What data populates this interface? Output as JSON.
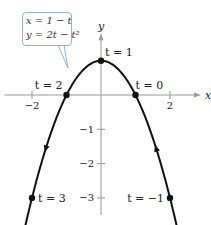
{
  "diagram": {
    "type": "parametric-curve",
    "equations": {
      "x_eq": "x = 1 − t",
      "y_eq": "y = 2t − t²"
    },
    "axes": {
      "x_label": "x",
      "y_label": "y",
      "x_ticks": [
        {
          "value": -2,
          "label": "−2"
        },
        {
          "value": 2,
          "label": "2"
        }
      ],
      "y_ticks": [
        {
          "value": -1,
          "label": "−1"
        },
        {
          "value": -2,
          "label": "−2"
        },
        {
          "value": -3,
          "label": "−3"
        }
      ],
      "x_range": [
        -2.8,
        2.9
      ],
      "y_range": [
        -3.5,
        1.8
      ]
    },
    "t_range": [
      -1.5,
      3.5
    ],
    "points": [
      {
        "t": -1,
        "label": "t = −1"
      },
      {
        "t": 0,
        "label": "t = 0"
      },
      {
        "t": 1,
        "label": "t = 1"
      },
      {
        "t": 2,
        "label": "t = 2"
      },
      {
        "t": 3,
        "label": "t = 3"
      }
    ],
    "direction_arrows": [
      {
        "t": 2.6,
        "direction": "down"
      },
      {
        "t": -0.6,
        "direction": "up"
      }
    ],
    "colors": {
      "curve": "#111111",
      "axes": "#999999",
      "callout_border": "#8fb3d9",
      "text": "#222222"
    }
  }
}
